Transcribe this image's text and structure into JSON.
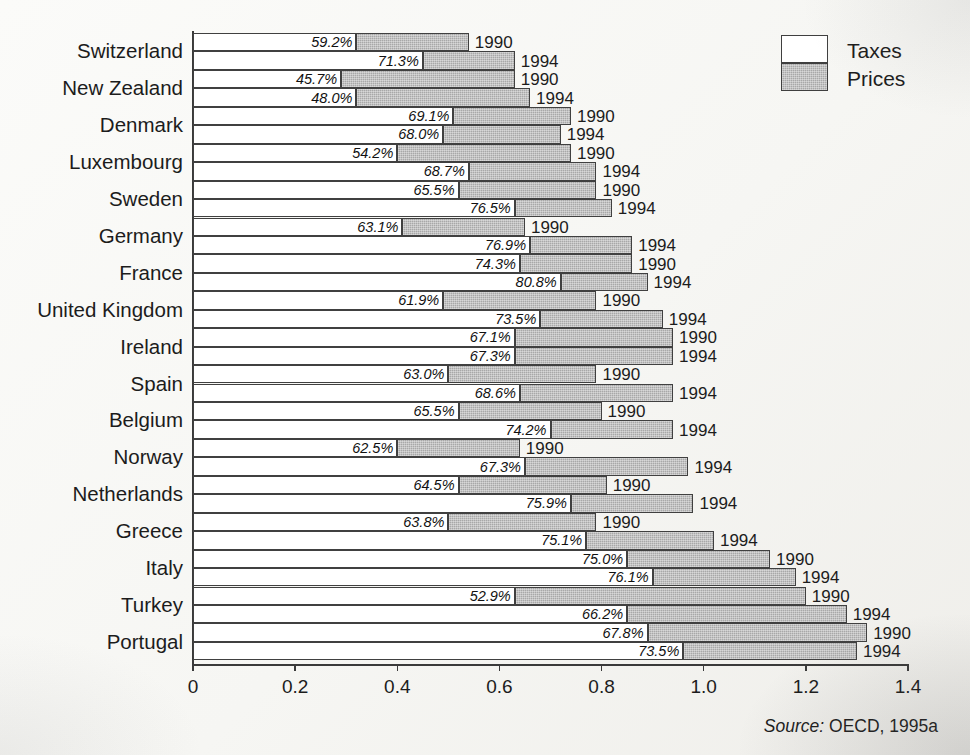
{
  "legend": {
    "taxes_label": "Taxes",
    "prices_label": "Prices"
  },
  "source": {
    "label": "Source:",
    "text": "OECD, 1995a"
  },
  "axis": {
    "tick_labels": [
      "0",
      "0.2",
      "0.4",
      "0.6",
      "0.8",
      "1.0",
      "1.2",
      "1.4"
    ]
  },
  "chart_data": {
    "type": "bar",
    "orientation": "horizontal",
    "stacked": true,
    "title": "",
    "xlabel": "",
    "ylabel": "",
    "xlim": [
      0,
      1.4
    ],
    "xticks": [
      0,
      0.2,
      0.4,
      0.6,
      0.8,
      1.0,
      1.2,
      1.4
    ],
    "grid": false,
    "legend_position": "top-right",
    "series": [
      {
        "name": "Taxes",
        "color": "#ffffff"
      },
      {
        "name": "Prices",
        "color": "#a8a8a8"
      }
    ],
    "categories": [
      "Switzerland",
      "New Zealand",
      "Denmark",
      "Luxembourg",
      "Sweden",
      "Germany",
      "France",
      "United Kingdom",
      "Ireland",
      "Spain",
      "Belgium",
      "Norway",
      "Netherlands",
      "Greece",
      "Italy",
      "Turkey",
      "Portugal"
    ],
    "year_labels": [
      "1990",
      "1994"
    ],
    "rows": [
      {
        "country": "Switzerland",
        "year": "1990",
        "tax_share": "59.2%",
        "tax_share_value": 59.2,
        "total": 0.54,
        "taxes": 0.32,
        "prices": 0.22
      },
      {
        "country": "Switzerland",
        "year": "1994",
        "tax_share": "71.3%",
        "tax_share_value": 71.3,
        "total": 0.63,
        "taxes": 0.45,
        "prices": 0.18
      },
      {
        "country": "New Zealand",
        "year": "1990",
        "tax_share": "45.7%",
        "tax_share_value": 45.7,
        "total": 0.63,
        "taxes": 0.29,
        "prices": 0.34
      },
      {
        "country": "New Zealand",
        "year": "1994",
        "tax_share": "48.0%",
        "tax_share_value": 48.0,
        "total": 0.66,
        "taxes": 0.32,
        "prices": 0.34
      },
      {
        "country": "Denmark",
        "year": "1990",
        "tax_share": "69.1%",
        "tax_share_value": 69.1,
        "total": 0.74,
        "taxes": 0.51,
        "prices": 0.23
      },
      {
        "country": "Denmark",
        "year": "1994",
        "tax_share": "68.0%",
        "tax_share_value": 68.0,
        "total": 0.72,
        "taxes": 0.49,
        "prices": 0.23
      },
      {
        "country": "Luxembourg",
        "year": "1990",
        "tax_share": "54.2%",
        "tax_share_value": 54.2,
        "total": 0.74,
        "taxes": 0.4,
        "prices": 0.34
      },
      {
        "country": "Luxembourg",
        "year": "1994",
        "tax_share": "68.7%",
        "tax_share_value": 68.7,
        "total": 0.79,
        "taxes": 0.54,
        "prices": 0.25
      },
      {
        "country": "Sweden",
        "year": "1990",
        "tax_share": "65.5%",
        "tax_share_value": 65.5,
        "total": 0.79,
        "taxes": 0.52,
        "prices": 0.27
      },
      {
        "country": "Sweden",
        "year": "1994",
        "tax_share": "76.5%",
        "tax_share_value": 76.5,
        "total": 0.82,
        "taxes": 0.63,
        "prices": 0.19
      },
      {
        "country": "Germany",
        "year": "1990",
        "tax_share": "63.1%",
        "tax_share_value": 63.1,
        "total": 0.65,
        "taxes": 0.41,
        "prices": 0.24
      },
      {
        "country": "Germany",
        "year": "1994",
        "tax_share": "76.9%",
        "tax_share_value": 76.9,
        "total": 0.86,
        "taxes": 0.66,
        "prices": 0.2
      },
      {
        "country": "France",
        "year": "1990",
        "tax_share": "74.3%",
        "tax_share_value": 74.3,
        "total": 0.86,
        "taxes": 0.64,
        "prices": 0.22
      },
      {
        "country": "France",
        "year": "1994",
        "tax_share": "80.8%",
        "tax_share_value": 80.8,
        "total": 0.89,
        "taxes": 0.72,
        "prices": 0.17
      },
      {
        "country": "United Kingdom",
        "year": "1990",
        "tax_share": "61.9%",
        "tax_share_value": 61.9,
        "total": 0.79,
        "taxes": 0.49,
        "prices": 0.3
      },
      {
        "country": "United Kingdom",
        "year": "1994",
        "tax_share": "73.5%",
        "tax_share_value": 73.5,
        "total": 0.92,
        "taxes": 0.68,
        "prices": 0.24
      },
      {
        "country": "Ireland",
        "year": "1990",
        "tax_share": "67.1%",
        "tax_share_value": 67.1,
        "total": 0.94,
        "taxes": 0.63,
        "prices": 0.31
      },
      {
        "country": "Ireland",
        "year": "1994",
        "tax_share": "67.3%",
        "tax_share_value": 67.3,
        "total": 0.94,
        "taxes": 0.63,
        "prices": 0.31
      },
      {
        "country": "Spain",
        "year": "1990",
        "tax_share": "63.0%",
        "tax_share_value": 63.0,
        "total": 0.79,
        "taxes": 0.5,
        "prices": 0.29
      },
      {
        "country": "Spain",
        "year": "1994",
        "tax_share": "68.6%",
        "tax_share_value": 68.6,
        "total": 0.94,
        "taxes": 0.64,
        "prices": 0.3
      },
      {
        "country": "Belgium",
        "year": "1990",
        "tax_share": "65.5%",
        "tax_share_value": 65.5,
        "total": 0.8,
        "taxes": 0.52,
        "prices": 0.28
      },
      {
        "country": "Belgium",
        "year": "1994",
        "tax_share": "74.2%",
        "tax_share_value": 74.2,
        "total": 0.94,
        "taxes": 0.7,
        "prices": 0.24
      },
      {
        "country": "Norway",
        "year": "1990",
        "tax_share": "62.5%",
        "tax_share_value": 62.5,
        "total": 0.64,
        "taxes": 0.4,
        "prices": 0.24
      },
      {
        "country": "Norway",
        "year": "1994",
        "tax_share": "67.3%",
        "tax_share_value": 67.3,
        "total": 0.97,
        "taxes": 0.65,
        "prices": 0.32
      },
      {
        "country": "Netherlands",
        "year": "1990",
        "tax_share": "64.5%",
        "tax_share_value": 64.5,
        "total": 0.81,
        "taxes": 0.52,
        "prices": 0.29
      },
      {
        "country": "Netherlands",
        "year": "1994",
        "tax_share": "75.9%",
        "tax_share_value": 75.9,
        "total": 0.98,
        "taxes": 0.74,
        "prices": 0.24
      },
      {
        "country": "Greece",
        "year": "1990",
        "tax_share": "63.8%",
        "tax_share_value": 63.8,
        "total": 0.79,
        "taxes": 0.5,
        "prices": 0.29
      },
      {
        "country": "Greece",
        "year": "1994",
        "tax_share": "75.1%",
        "tax_share_value": 75.1,
        "total": 1.02,
        "taxes": 0.77,
        "prices": 0.25
      },
      {
        "country": "Italy",
        "year": "1990",
        "tax_share": "75.0%",
        "tax_share_value": 75.0,
        "total": 1.13,
        "taxes": 0.85,
        "prices": 0.28
      },
      {
        "country": "Italy",
        "year": "1994",
        "tax_share": "76.1%",
        "tax_share_value": 76.1,
        "total": 1.18,
        "taxes": 0.9,
        "prices": 0.28
      },
      {
        "country": "Turkey",
        "year": "1990",
        "tax_share": "52.9%",
        "tax_share_value": 52.9,
        "total": 1.2,
        "taxes": 0.63,
        "prices": 0.57
      },
      {
        "country": "Turkey",
        "year": "1994",
        "tax_share": "66.2%",
        "tax_share_value": 66.2,
        "total": 1.28,
        "taxes": 0.85,
        "prices": 0.43
      },
      {
        "country": "Portugal",
        "year": "1990",
        "tax_share": "67.8%",
        "tax_share_value": 67.8,
        "total": 1.32,
        "taxes": 0.89,
        "prices": 0.43
      },
      {
        "country": "Portugal",
        "year": "1994",
        "tax_share": "73.5%",
        "tax_share_value": 73.5,
        "total": 1.3,
        "taxes": 0.96,
        "prices": 0.34
      }
    ]
  }
}
